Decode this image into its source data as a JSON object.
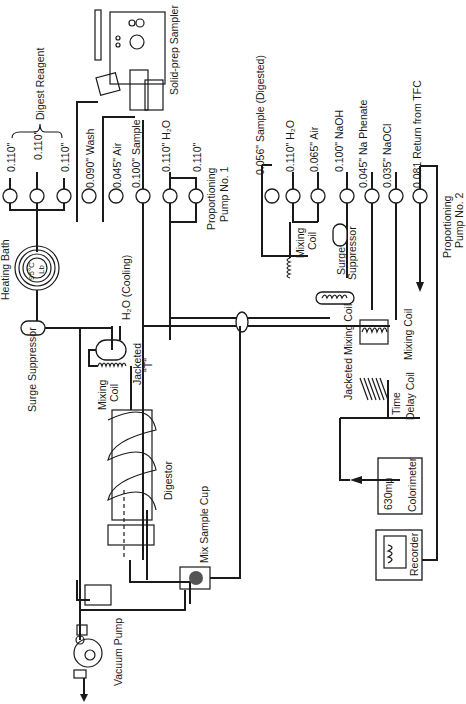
{
  "figure": {
    "orientation": "rotated-90-ccw",
    "colors": {
      "ink": "#1a1a1a",
      "background": "#ffffff"
    }
  },
  "components": {
    "heating_bath": {
      "label": "Heating Bath",
      "temp": "95°C",
      "sub": "Lb"
    },
    "surge_suppressor_1": {
      "label": "Surge Suppressor"
    },
    "surge_suppressor_2": {
      "label1": "Surge",
      "label2": "Suppressor"
    },
    "mixing_coil_1": {
      "label1": "Mixing",
      "label2": "Coil"
    },
    "mixing_coil_2": {
      "label1": "Mixing",
      "label2": "Coil"
    },
    "mixing_coil_3": {
      "label": "Mixing Coil"
    },
    "jacketed_t": {
      "label1": "Jacketed",
      "label2": "\"T\""
    },
    "cooling": {
      "label": "H₂O (Cooling)"
    },
    "digestor": {
      "label": "Digestor"
    },
    "mix_sample_cup": {
      "label": "Mix Sample Cup"
    },
    "vacuum_pump": {
      "label": "Vacuum Pump"
    },
    "solid_prep_sampler": {
      "label": "Solid-prep Sampler"
    },
    "pump1": {
      "label1": "Proportioning",
      "label2": "Pump No. 1"
    },
    "pump2": {
      "label1": "Proportioning",
      "label2": "Pump No. 2"
    },
    "jacketed_mixing_coil": {
      "label": "Jacketed Mixing Coil"
    },
    "time_delay_coil": {
      "label1": "Time",
      "label2": "Delay Coil"
    },
    "colorimeter": {
      "label": "Colorimeter",
      "wavelength": "630mμ"
    },
    "recorder": {
      "label": "Recorder"
    }
  },
  "tubes": {
    "digest_reagent": {
      "label": "Digest Reagent",
      "sizes": [
        "0.110\"",
        "0.110\"",
        "0.110\""
      ]
    },
    "wash": "0.090\" Wash",
    "air1": "0.045\" Air",
    "sample": "0.100\" Sample",
    "h2o_1": "0.110\" H₂O",
    "h2o_1b": "0.110\"",
    "sample_digested": "0.056\" Sample (Digested)",
    "h2o_2": "0.110\" H₂O",
    "air2": "0.065\" Air",
    "naoh": "0.100\" NaOH",
    "na_phenate": "0.045\" Na Phenate",
    "naocl": "0.035\" NaOCl",
    "return_tfc": "0.081 Return from TFC"
  }
}
